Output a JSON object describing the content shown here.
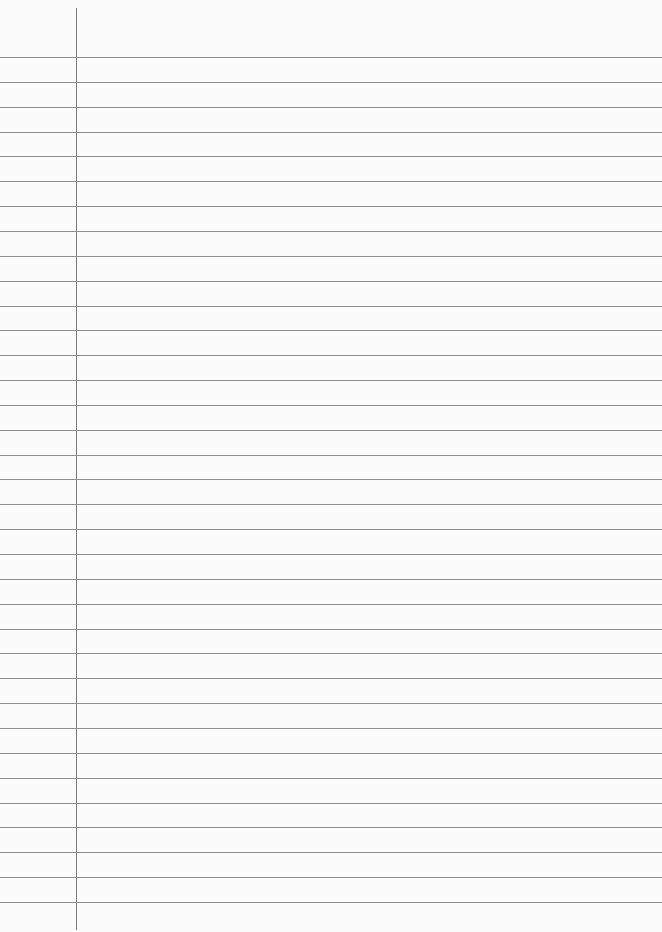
{
  "paper": {
    "type": "lined-paper",
    "background_color": "#fbfbfb",
    "rule_color": "#8e8e8e",
    "margin_color": "#7a7a7a",
    "first_rule_y": 57,
    "rule_spacing": 24.85,
    "rule_count": 35,
    "margin_x": 76
  }
}
